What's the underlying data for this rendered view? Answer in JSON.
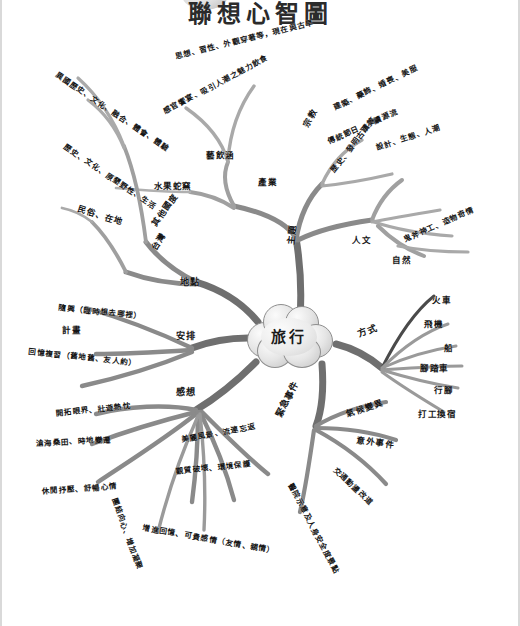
{
  "title": "聯想心智圖",
  "center": {
    "label": "旅行"
  },
  "colors": {
    "branch_dark": "#7d7d7d",
    "branch_mid": "#9a9a9a",
    "branch_light": "#b6b6b6",
    "ink": "#161616",
    "node_fill": "#e2e2e2",
    "node_stroke": "#8e8e8e",
    "page_bg": "#ffffff"
  },
  "branches": [
    {
      "id": "theme",
      "label": "主題",
      "children": [
        {
          "label": "藝飲涵"
        },
        {
          "label": "感官饗宴、吸引人潮之魅力飲食"
        },
        {
          "label": "思想、習性、外觀穿著等，現在與古早"
        },
        {
          "label": "產業"
        },
        {
          "label": "水果蛇窯"
        },
        {
          "label": "宗教"
        },
        {
          "label": "傳統節日、承續源流"
        },
        {
          "label": "人文"
        },
        {
          "label": "歷史、發明古蹟等"
        },
        {
          "label": "建築、藥飾、婚喪、美服"
        },
        {
          "label": "設計、生態、人潮"
        },
        {
          "label": "自然"
        },
        {
          "label": "鬼斧神工、造物奇情"
        }
      ]
    },
    {
      "id": "place",
      "label": "地點",
      "children": [
        {
          "label": "異國歷史、文化、融合、體會、體驗"
        },
        {
          "label": "歷史、文化、原墾野性、生活"
        },
        {
          "label": "其他國度"
        },
        {
          "label": "民俗、在地"
        },
        {
          "label": "台灣"
        }
      ]
    },
    {
      "id": "arrange",
      "label": "安排",
      "children": [
        {
          "label": "隨興（臨時想去哪裡）"
        },
        {
          "label": "計畫"
        },
        {
          "label": "回憶複習（舊地舊、友人約）"
        }
      ]
    },
    {
      "id": "gain",
      "label": "感想",
      "children": [
        {
          "label": "開拓眼界、壯遊熱忱"
        },
        {
          "label": "滄海桑田、時地變遷"
        },
        {
          "label": "休閒抒壓、舒暢心情"
        },
        {
          "label": "美麗風景、流連忘返"
        },
        {
          "label": "觀質破壞、環境保護"
        },
        {
          "label": "增進回憶、可貴感情（友情、親情）"
        },
        {
          "label": "團結向心、增加凝聚"
        }
      ]
    },
    {
      "id": "method",
      "label": "方式",
      "children": [
        {
          "label": "火車"
        },
        {
          "label": "飛機"
        },
        {
          "label": "船"
        },
        {
          "label": "腳踏車"
        },
        {
          "label": "行腳"
        },
        {
          "label": "打工換宿"
        }
      ]
    },
    {
      "id": "emergency",
      "label": "緊急事件",
      "children": [
        {
          "label": "氣候變異"
        },
        {
          "label": "意外事件"
        },
        {
          "label": "交通動盪改道"
        },
        {
          "label": "醫院示意及人身安全度景點"
        }
      ]
    }
  ]
}
